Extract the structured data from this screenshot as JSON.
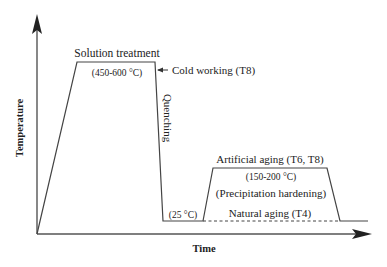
{
  "diagram": {
    "axes": {
      "y_label": "Temperature",
      "x_label": "Time"
    },
    "stages": {
      "solution": {
        "label": "Solution treatment",
        "temp_range": "(450-600 °C)"
      },
      "cold_working": {
        "label": "Cold working (T8)"
      },
      "quenching": {
        "label": "Quenching"
      },
      "room_temp": {
        "label": "(25 °C)"
      },
      "artificial_aging": {
        "label": "Artificial aging (T6, T8)",
        "temp_range": "(150-200 °C)",
        "note": "(Precipitation hardening)"
      },
      "natural_aging": {
        "label": "Natural aging (T4)"
      }
    },
    "colors": {
      "line": "#333333",
      "text": "#222222"
    }
  }
}
